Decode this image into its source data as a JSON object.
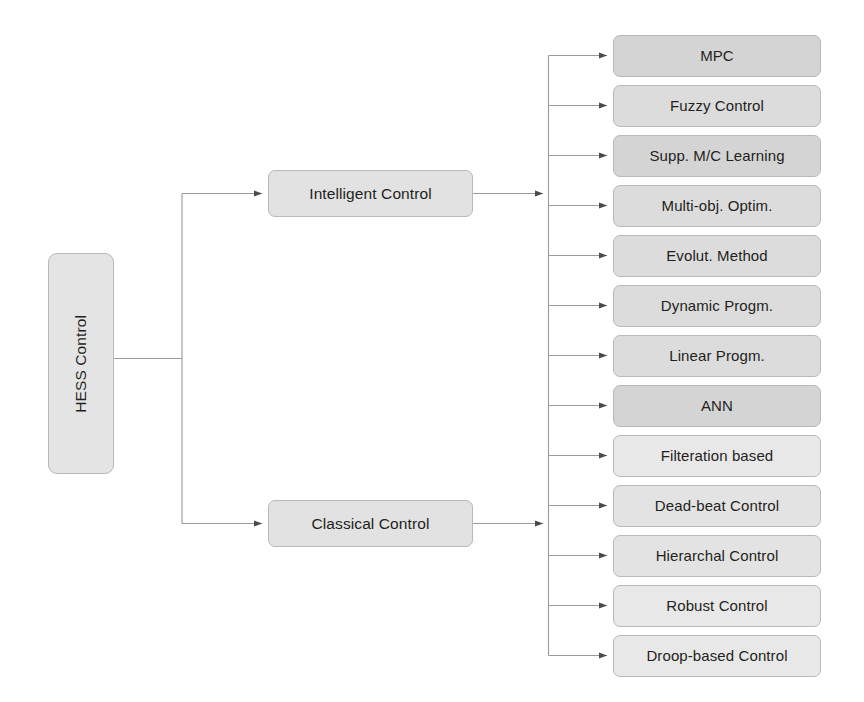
{
  "diagram": {
    "title": "HESS Control",
    "type": "tree-taxonomy",
    "orientation": "left-to-right",
    "colors": {
      "node_fill": "#dedede",
      "node_fill_alt": "#e3e3e3",
      "node_border": "#b9b9b9",
      "connector": "#8d8d8d",
      "text": "#231f20",
      "background": "#ffffff"
    }
  },
  "root": {
    "label": "HESS Control",
    "rotated": "-90deg"
  },
  "branches": [
    {
      "id": "intelligent",
      "label": "Intelligent Control",
      "children": [
        {
          "id": "mpc",
          "label": "MPC"
        },
        {
          "id": "fuzzy-control",
          "label": "Fuzzy Control"
        },
        {
          "id": "supp-mc-learning",
          "label": "Supp. M/C Learning"
        },
        {
          "id": "multi-obj-optim",
          "label": "Multi-obj. Optim."
        },
        {
          "id": "evolut-method",
          "label": "Evolut. Method"
        },
        {
          "id": "dynamic-progm",
          "label": "Dynamic Progm."
        },
        {
          "id": "linear-progm",
          "label": "Linear Progm."
        },
        {
          "id": "ann",
          "label": "ANN"
        }
      ]
    },
    {
      "id": "classical",
      "label": "Classical Control",
      "children": [
        {
          "id": "filteration-based",
          "label": "Filteration based"
        },
        {
          "id": "dead-beat-control",
          "label": "Dead-beat Control"
        },
        {
          "id": "hierarchal-control",
          "label": "Hierarchal Control"
        },
        {
          "id": "robust-control",
          "label": "Robust Control"
        },
        {
          "id": "droop-based-control",
          "label": "Droop-based Control"
        }
      ]
    }
  ],
  "leaves_flat": [
    "MPC",
    "Fuzzy Control",
    "Supp. M/C Learning",
    "Multi-obj. Optim.",
    "Evolut. Method",
    "Dynamic Progm.",
    "Linear Progm.",
    "ANN",
    "Filteration based",
    "Dead-beat Control",
    "Hierarchal Control",
    "Robust Control",
    "Droop-based Control"
  ]
}
